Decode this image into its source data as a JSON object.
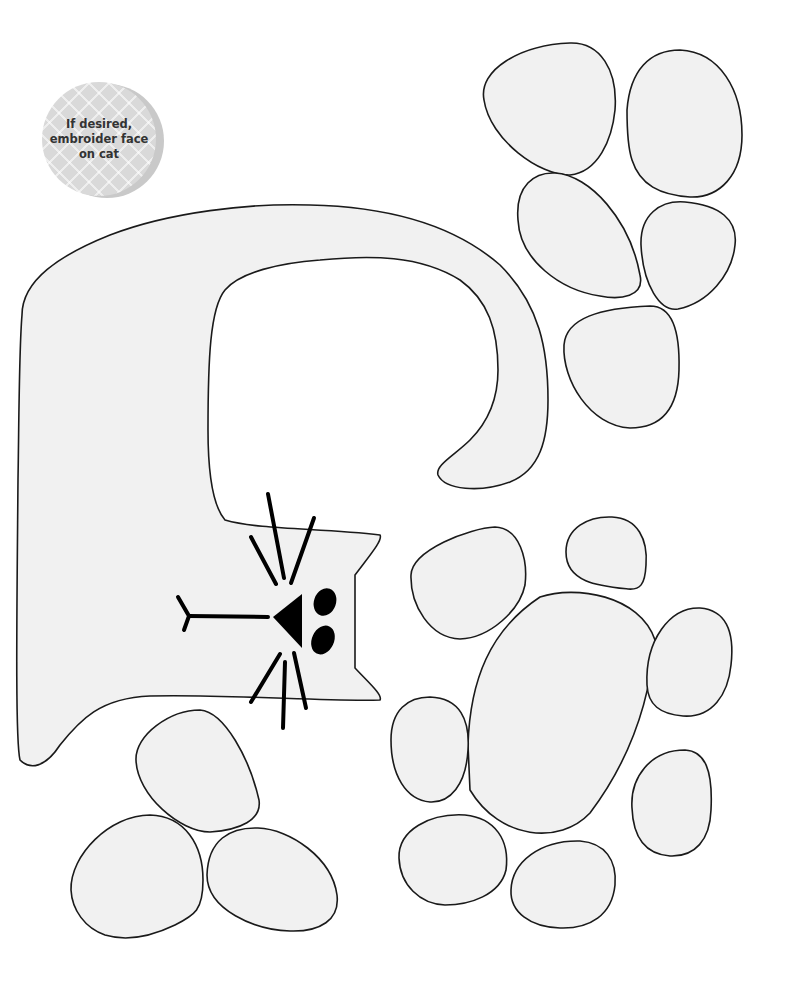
{
  "pattern": {
    "colors": {
      "fill": "#f1f1f1",
      "outline": "#1a1a1a",
      "background": "#ffffff",
      "badge": "#d9d9d9",
      "badge_shadow": "#c9c9c9",
      "badge_text": "#333333"
    },
    "note_badge": {
      "line1": "If desired,",
      "line2": "embroider face",
      "line3": "on cat"
    },
    "pieces": [
      {
        "name": "cat-body",
        "description": "cat shape with curled tail and face"
      },
      {
        "name": "paw-print-top-right",
        "toes": 4,
        "pads": 1
      },
      {
        "name": "paw-print-bottom-right",
        "toes": 6,
        "pads": 1
      },
      {
        "name": "paw-print-bottom-left",
        "toes": 3
      }
    ]
  }
}
